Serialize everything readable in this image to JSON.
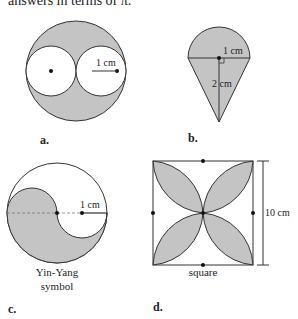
{
  "header": {
    "text": "answers in terms of π."
  },
  "figures": [
    {
      "label": "a.",
      "dimension": "1 cm"
    },
    {
      "label": "b.",
      "dimension_top": "1 cm",
      "dimension_side": "2 cm"
    },
    {
      "label": "c.",
      "dimension": "1 cm",
      "caption_line1": "Yin-Yang",
      "caption_line2": "symbol"
    },
    {
      "label": "d.",
      "dimension": "10 cm",
      "caption": "square"
    }
  ],
  "colors": {
    "shade": "#c4c4c4",
    "stroke": "#333333"
  }
}
